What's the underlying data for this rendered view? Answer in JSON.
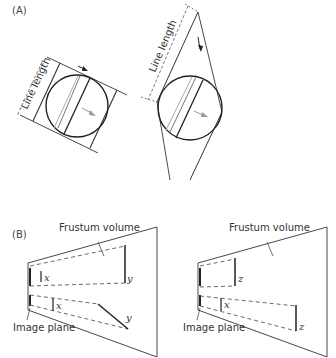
{
  "panel_a": {
    "label": "(A)",
    "left_figure": {
      "dimension_label": "Line length"
    },
    "right_figure": {
      "dimension_label": "Line length"
    }
  },
  "panel_b": {
    "label": "(B)",
    "left_figure": {
      "volume_label": "Frustum volume",
      "plane_label": "Image plane",
      "var_x1": "x",
      "var_y1": "y",
      "var_x2": "x",
      "var_y2": "y"
    },
    "right_figure": {
      "volume_label": "Frustum volume",
      "plane_label": "Image plane",
      "var_z1": "z",
      "var_x2": "x",
      "var_z2": "z"
    }
  },
  "colors": {
    "stroke": "#333333",
    "light_stroke": "#999999",
    "background": "#ffffff"
  }
}
